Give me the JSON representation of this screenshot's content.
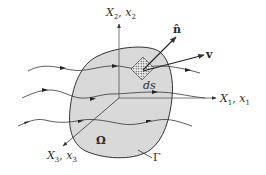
{
  "diagram": {
    "colors": {
      "background": "#ffffff",
      "region_fill": "#d9d9d9",
      "stroke": "#3a3a3a",
      "axis": "#555555"
    },
    "axes": {
      "x1": {
        "label_main": "X",
        "sub_main": "1",
        "label_sec": "x",
        "sub_sec": "1"
      },
      "x2": {
        "label_main": "X",
        "sub_main": "2",
        "label_sec": "x",
        "sub_sec": "2"
      },
      "x3": {
        "label_main": "X",
        "sub_main": "3",
        "label_sec": "x",
        "sub_sec": "3"
      },
      "separator": ", "
    },
    "region_label": "Ω",
    "boundary_label": "Γ",
    "surface_element_label": "ds",
    "normal_label": "n̂",
    "velocity_label": "v",
    "streamlines": [
      {
        "id": "upper",
        "arrow_count": 3
      },
      {
        "id": "middle",
        "arrow_count": 3
      },
      {
        "id": "lower",
        "arrow_count": 3
      }
    ]
  }
}
